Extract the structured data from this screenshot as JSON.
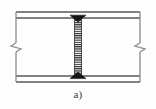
{
  "figure": {
    "caption": "а)",
    "colors": {
      "background": "#fefefe",
      "line": "#595959",
      "line_light": "#8a8a8a",
      "weld_fill": "#161616",
      "hatch": "#2b2b2b",
      "caption_text": "#3a3a3a"
    },
    "geometry": {
      "canvas_width": 156,
      "canvas_height": 109,
      "top_flange_outer_y": 12,
      "top_flange_inner_y": 18,
      "bottom_flange_inner_y": 76,
      "bottom_flange_outer_y": 82,
      "flange_left_x": 16,
      "flange_right_x": 140,
      "web_center_x": 78,
      "web_half_width": 4,
      "break_line_left_x": 16,
      "break_line_right_x": 140,
      "break_symbol_y": 47
    }
  },
  "elements": {
    "top_flange_label": "top flange",
    "bottom_flange_label": "bottom flange",
    "web_label": "hatched web plate",
    "top_weld_label": "top fillet weld",
    "bottom_weld_label": "bottom fillet weld",
    "left_break_label": "left break line",
    "right_break_label": "right break line"
  }
}
